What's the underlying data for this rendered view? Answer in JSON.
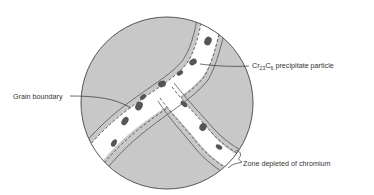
{
  "diagram": {
    "labels": {
      "precipitate": {
        "prefix": "Cr",
        "sub1": "23",
        "mid": "C",
        "sub2": "6",
        "suffix": " precipitate particle"
      },
      "grain_boundary": "Grain boundary",
      "depleted_zone": "Zone depleted of chromium"
    },
    "colors": {
      "grain": "#c8c8c8",
      "zone": "#ffffff",
      "particle": "#555555",
      "outline": "#555555",
      "text": "#333333"
    }
  }
}
